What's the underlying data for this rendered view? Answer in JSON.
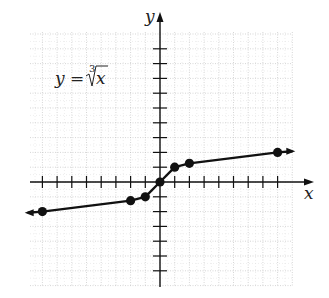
{
  "chart_data": {
    "type": "line",
    "equation_label": "y = ∛x",
    "equation_lhs": "y =",
    "radical_index": "3",
    "radicand": "x",
    "xlabel": "x",
    "ylabel": "y",
    "xlim": [
      -9,
      9
    ],
    "ylim": [
      -8,
      9
    ],
    "grid": true,
    "tick_interval": 1,
    "tick_labels_shown": false,
    "series": [
      {
        "name": "y = cube root of x",
        "points": [
          {
            "x": -8,
            "y": -2
          },
          {
            "x": -2,
            "y": -1.26
          },
          {
            "x": -1,
            "y": -1
          },
          {
            "x": 0,
            "y": 0
          },
          {
            "x": 1,
            "y": 1
          },
          {
            "x": 2,
            "y": 1.26
          },
          {
            "x": 8,
            "y": 2
          }
        ],
        "arrows_both_ends": true
      }
    ]
  },
  "style": {
    "line_color": "#111111",
    "grid_color": "#bbbbbb",
    "background": "#ffffff"
  }
}
